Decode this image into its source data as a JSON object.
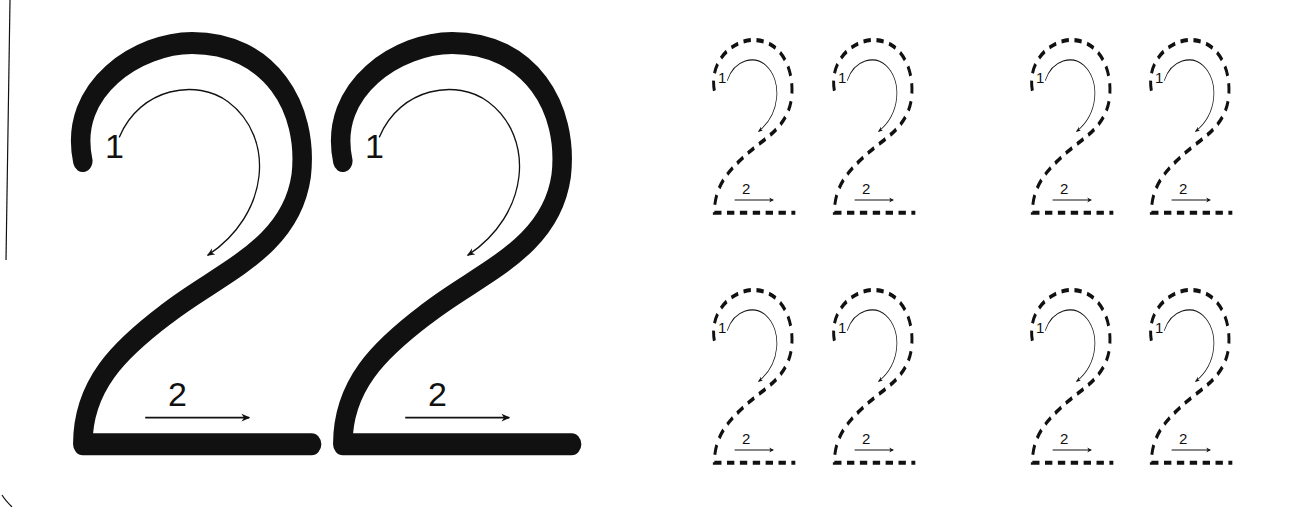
{
  "page": {
    "colors": {
      "ink": "#111111",
      "paper": "#ffffff"
    }
  },
  "large_digits": [
    {
      "digit": "2",
      "stroke_labels": [
        "1",
        "2"
      ],
      "style": "solid"
    },
    {
      "digit": "2",
      "stroke_labels": [
        "1",
        "2"
      ],
      "style": "solid"
    }
  ],
  "practice_groups": [
    {
      "digits": [
        {
          "digit": "2",
          "stroke_labels": [
            "1",
            "2"
          ],
          "style": "dashed"
        },
        {
          "digit": "2",
          "stroke_labels": [
            "1",
            "2"
          ],
          "style": "dashed"
        }
      ]
    },
    {
      "digits": [
        {
          "digit": "2",
          "stroke_labels": [
            "1",
            "2"
          ],
          "style": "dashed"
        },
        {
          "digit": "2",
          "stroke_labels": [
            "1",
            "2"
          ],
          "style": "dashed"
        }
      ]
    },
    {
      "digits": [
        {
          "digit": "2",
          "stroke_labels": [
            "1",
            "2"
          ],
          "style": "dashed"
        },
        {
          "digit": "2",
          "stroke_labels": [
            "1",
            "2"
          ],
          "style": "dashed"
        }
      ]
    },
    {
      "digits": [
        {
          "digit": "2",
          "stroke_labels": [
            "1",
            "2"
          ],
          "style": "dashed"
        },
        {
          "digit": "2",
          "stroke_labels": [
            "1",
            "2"
          ],
          "style": "dashed"
        }
      ]
    }
  ]
}
